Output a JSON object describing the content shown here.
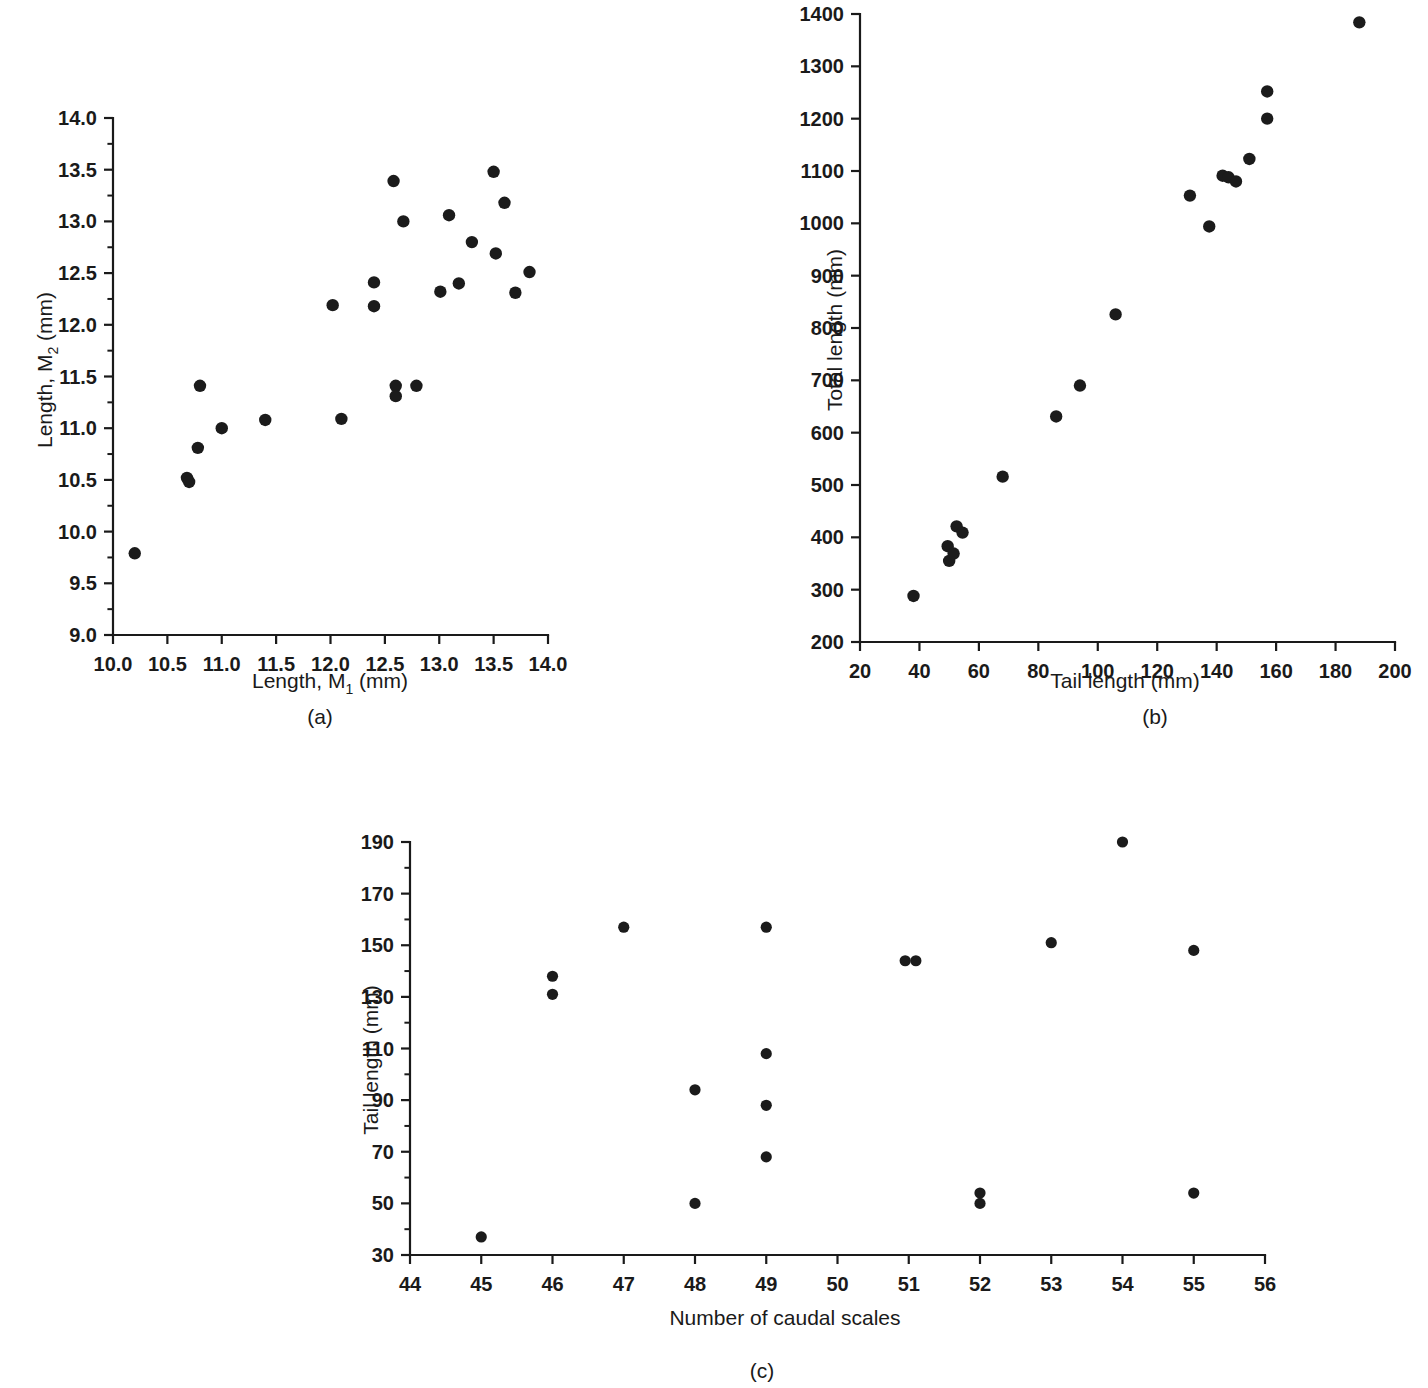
{
  "figure": {
    "panels": [
      {
        "caption": "(a)",
        "xlabel_main": "Length, M",
        "xlabel_sub": "1",
        "xlabel_tail": " (mm)",
        "ylabel_main": "Length, M",
        "ylabel_sub": "2",
        "ylabel_tail": " (mm)"
      },
      {
        "caption": "(b)",
        "xlabel": "Tail length (mm)",
        "ylabel": "Total length (mm)"
      },
      {
        "caption": "(c)",
        "xlabel": "Number of caudal scales",
        "ylabel": "Tail length (mm)"
      }
    ]
  },
  "chart_data": [
    {
      "type": "scatter",
      "panel": "(a)",
      "title": "",
      "xlabel": "Length, M1 (mm)",
      "ylabel": "Length, M2 (mm)",
      "xlim": [
        10.0,
        14.0
      ],
      "ylim": [
        9.0,
        14.0
      ],
      "xticks": [
        10.0,
        10.5,
        11.0,
        11.5,
        12.0,
        12.5,
        13.0,
        13.5,
        14.0
      ],
      "xticklabels": [
        "10.0",
        "10.5",
        "11.0",
        "11.5",
        "12.0",
        "12.5",
        "13.0",
        "13.5",
        "14.0"
      ],
      "yticks": [
        9.0,
        9.5,
        10.0,
        10.5,
        11.0,
        11.5,
        12.0,
        12.5,
        13.0,
        13.5,
        14.0
      ],
      "yticklabels": [
        "9.0",
        "9.5",
        "10.0",
        "10.5",
        "11.0",
        "11.5",
        "12.0",
        "12.5",
        "13.0",
        "13.5",
        "14.0"
      ],
      "grid": false,
      "legend": "none",
      "points": [
        [
          10.2,
          9.79
        ],
        [
          10.68,
          10.52
        ],
        [
          10.7,
          10.48
        ],
        [
          10.78,
          10.81
        ],
        [
          10.8,
          11.41
        ],
        [
          11.0,
          11.0
        ],
        [
          11.4,
          11.08
        ],
        [
          12.02,
          12.19
        ],
        [
          12.1,
          11.09
        ],
        [
          12.4,
          12.41
        ],
        [
          12.4,
          12.18
        ],
        [
          12.58,
          13.39
        ],
        [
          12.6,
          11.41
        ],
        [
          12.6,
          11.31
        ],
        [
          12.67,
          13.0
        ],
        [
          12.79,
          11.41
        ],
        [
          13.01,
          12.32
        ],
        [
          13.09,
          13.06
        ],
        [
          13.18,
          12.4
        ],
        [
          13.3,
          12.8
        ],
        [
          13.5,
          13.48
        ],
        [
          13.52,
          12.69
        ],
        [
          13.6,
          13.18
        ],
        [
          13.7,
          12.31
        ],
        [
          13.83,
          12.51
        ]
      ]
    },
    {
      "type": "scatter",
      "panel": "(b)",
      "title": "",
      "xlabel": "Tail length (mm)",
      "ylabel": "Total length (mm)",
      "xlim": [
        20,
        200
      ],
      "ylim": [
        200,
        1400
      ],
      "xticks": [
        20,
        40,
        60,
        80,
        100,
        120,
        140,
        160,
        180,
        200
      ],
      "xticklabels": [
        "20",
        "40",
        "60",
        "80",
        "100",
        "120",
        "140",
        "160",
        "180",
        "200"
      ],
      "yticks": [
        200,
        300,
        400,
        500,
        600,
        700,
        800,
        900,
        1000,
        1100,
        1200,
        1300,
        1400
      ],
      "yticklabels": [
        "200",
        "300",
        "400",
        "500",
        "600",
        "700",
        "800",
        "900",
        "1000",
        "1100",
        "1200",
        "1300",
        "1400"
      ],
      "grid": false,
      "legend": "none",
      "points": [
        [
          38,
          288
        ],
        [
          49.5,
          383
        ],
        [
          50,
          355
        ],
        [
          51.5,
          369
        ],
        [
          52.5,
          421
        ],
        [
          54.5,
          409
        ],
        [
          68,
          516
        ],
        [
          86,
          631
        ],
        [
          94,
          690
        ],
        [
          106,
          826
        ],
        [
          131,
          1053
        ],
        [
          137.5,
          994
        ],
        [
          142,
          1091
        ],
        [
          144,
          1088
        ],
        [
          146.5,
          1080
        ],
        [
          151,
          1123
        ],
        [
          157,
          1252
        ],
        [
          157,
          1200
        ],
        [
          188,
          1384
        ]
      ]
    },
    {
      "type": "scatter",
      "panel": "(c)",
      "title": "",
      "xlabel": "Number of caudal scales",
      "ylabel": "Tail length (mm)",
      "xlim": [
        44,
        56
      ],
      "ylim": [
        30,
        190
      ],
      "xticks": [
        44,
        45,
        46,
        47,
        48,
        49,
        50,
        51,
        52,
        53,
        54,
        55,
        56
      ],
      "xticklabels": [
        "44",
        "45",
        "46",
        "47",
        "48",
        "49",
        "50",
        "51",
        "52",
        "53",
        "54",
        "55",
        "56"
      ],
      "yticks": [
        30,
        50,
        70,
        90,
        110,
        130,
        150,
        170,
        190
      ],
      "yticklabels": [
        "30",
        "50",
        "70",
        "90",
        "110",
        "130",
        "150",
        "170",
        "190"
      ],
      "grid": false,
      "legend": "none",
      "points": [
        [
          45,
          37
        ],
        [
          46,
          138
        ],
        [
          46,
          131
        ],
        [
          47,
          157
        ],
        [
          48,
          94
        ],
        [
          48,
          50
        ],
        [
          49,
          157
        ],
        [
          49,
          108
        ],
        [
          49,
          88
        ],
        [
          49,
          68
        ],
        [
          50.95,
          144
        ],
        [
          51.1,
          144
        ],
        [
          52,
          54
        ],
        [
          52,
          50
        ],
        [
          53,
          151
        ],
        [
          54,
          190
        ],
        [
          55,
          148
        ],
        [
          55,
          54
        ]
      ]
    }
  ]
}
